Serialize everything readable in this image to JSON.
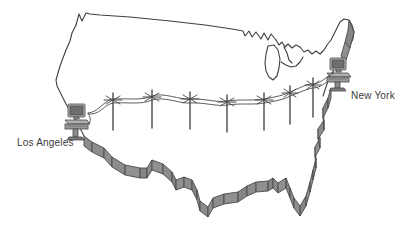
{
  "figure": {
    "kind": "network-diagram",
    "background_color": "#ffffff",
    "outline_color": "#3f3f3f",
    "border_fill_color": "#8c8c8c",
    "border_fill_dark": "#707070",
    "device_color": "#9a9a9a",
    "device_dark": "#5f5f5f",
    "wire_color": "#4a4a4a"
  },
  "labels": {
    "los_angeles": "Los Angeles",
    "new_york": "New York"
  },
  "nodes": [
    {
      "id": "la",
      "label": "Los Angeles",
      "icon": "desktop-computer-icon",
      "x": 78,
      "y": 112
    },
    {
      "id": "ny",
      "label": "New York",
      "icon": "desktop-computer-icon",
      "x": 336,
      "y": 66
    }
  ],
  "poles": {
    "count": 7,
    "icon": "telephone-pole-icon",
    "positions": [
      {
        "x": 113,
        "y_top": 93,
        "y_bottom": 130
      },
      {
        "x": 152,
        "y_top": 90,
        "y_bottom": 128
      },
      {
        "x": 190,
        "y_top": 92,
        "y_bottom": 129
      },
      {
        "x": 227,
        "y_top": 95,
        "y_bottom": 132
      },
      {
        "x": 264,
        "y_top": 93,
        "y_bottom": 130
      },
      {
        "x": 290,
        "y_top": 88,
        "y_bottom": 125
      },
      {
        "x": 313,
        "y_top": 80,
        "y_bottom": 118
      }
    ]
  },
  "link": {
    "from": "los_angeles",
    "to": "new_york",
    "style": "sagging-overhead-wire",
    "wire_count": 2
  }
}
